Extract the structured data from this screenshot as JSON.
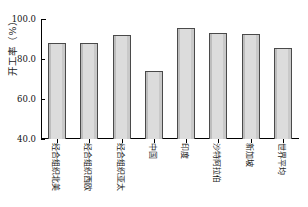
{
  "chart_data": {
    "type": "bar",
    "title": "",
    "xlabel": "",
    "ylabel": "开工率（%）",
    "ylim": [
      40.0,
      100.0
    ],
    "yticks": [
      "40.0",
      "60.0",
      "80.0",
      "100.0"
    ],
    "ytick_values": [
      40.0,
      60.0,
      80.0,
      100.0
    ],
    "grid": false,
    "legend": null,
    "categories": [
      "经合组织北美",
      "经合组织西欧",
      "经合组织亚太",
      "中国",
      "印度",
      "沙特阿拉伯",
      "新加坡",
      "世界平均"
    ],
    "values": [
      88.0,
      88.0,
      92.0,
      74.0,
      95.5,
      93.0,
      92.5,
      85.5
    ],
    "bar_color": "#d8d8d8",
    "bar_edge_color": "#4a4a4a",
    "axis_color": "#000000",
    "background_color": "#ffffff"
  }
}
